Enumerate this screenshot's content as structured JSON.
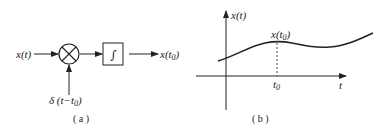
{
  "panel_a": {
    "caption": "( a )",
    "input_label": "x(t)",
    "multiplier_icon": "multiply-circle-icon",
    "impulse_label_prefix": "δ (t−t",
    "impulse_label_sub": "0",
    "impulse_label_suffix": ")",
    "integrator_symbol": "∫",
    "output_label_prefix": "x(t",
    "output_label_sub": "0",
    "output_label_suffix": ")"
  },
  "panel_b": {
    "caption": "( b )",
    "y_axis_label": "x(t)",
    "x_axis_label": "t",
    "tick_label_prefix": "t",
    "tick_label_sub": "0",
    "point_label_prefix": "x(t",
    "point_label_sub": "0",
    "point_label_suffix": ")"
  }
}
